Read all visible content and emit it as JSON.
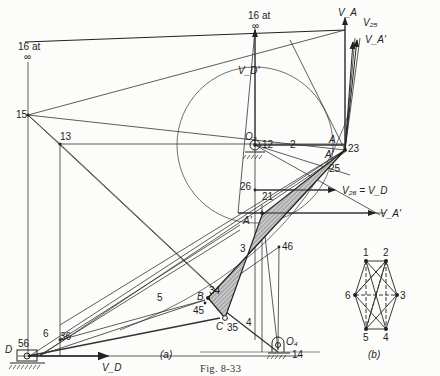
{
  "figure": {
    "caption": "Fig. 8-33",
    "subfigure_a_label": "(a)",
    "subfigure_b_label": "(b)"
  },
  "labels": {
    "pole16_left_line1": "16 at",
    "pole16_left_line2": "∞",
    "pole16_top_line1": "16 at",
    "pole16_top_line2": "∞",
    "p15": "15",
    "p13": "13",
    "p12": "12",
    "link2": "2",
    "A": "A",
    "A_prime": "A'",
    "p23": "23",
    "p25": "25",
    "p26": "26",
    "p21": "21",
    "A_prime_lower": "A'",
    "link3": "3",
    "p46": "46",
    "p34": "34",
    "B": "B",
    "p45": "45",
    "C": "C",
    "p35": "35",
    "link4": "4",
    "O4": "O₄",
    "p14": "14",
    "O2": "O₂",
    "link5": "5",
    "p36": "36",
    "p56": "56",
    "link6": "6",
    "D": "D",
    "VA": "V_A",
    "V25": "V₂₅",
    "VA_prime_top": "V_A'",
    "VD_prime": "V_D'",
    "V26_eq_VD": "V₂₆ = V_D",
    "VA_prime_right": "V_A'",
    "VD": "V_D"
  },
  "hexagon_b": {
    "vertices": [
      "1",
      "2",
      "3",
      "4",
      "5",
      "6"
    ]
  }
}
